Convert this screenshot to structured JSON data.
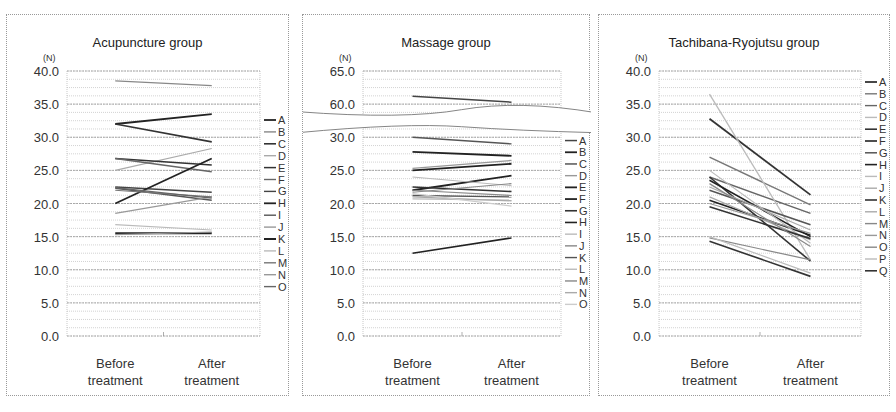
{
  "chart_data": [
    {
      "type": "line",
      "title": "Acupuncture group",
      "ylabel": "(N)",
      "xlabel": "",
      "categories": [
        "Before\ntreatment",
        "After\ntreatment"
      ],
      "yticks": [
        "0.0",
        "5.0",
        "10.0",
        "15.0",
        "20.0",
        "25.0",
        "30.0",
        "35.0",
        "40.0"
      ],
      "ylim": [
        0,
        40
      ],
      "grid": true,
      "legend_position": "right",
      "series": [
        {
          "name": "A",
          "values": [
            32.0,
            33.5
          ],
          "color": "#222222",
          "width": 1.8
        },
        {
          "name": "B",
          "values": [
            38.5,
            37.8
          ],
          "color": "#888888",
          "width": 1.2
        },
        {
          "name": "C",
          "values": [
            32.0,
            29.3
          ],
          "color": "#333333",
          "width": 1.6
        },
        {
          "name": "D",
          "values": [
            25.0,
            28.3
          ],
          "color": "#aaaaaa",
          "width": 1.2
        },
        {
          "name": "E",
          "values": [
            26.8,
            25.8
          ],
          "color": "#333333",
          "width": 1.5
        },
        {
          "name": "F",
          "values": [
            26.8,
            24.8
          ],
          "color": "#666666",
          "width": 1.4
        },
        {
          "name": "G",
          "values": [
            22.5,
            21.7
          ],
          "color": "#444444",
          "width": 1.4
        },
        {
          "name": "H",
          "values": [
            20.0,
            26.8
          ],
          "color": "#222222",
          "width": 1.8
        },
        {
          "name": "I",
          "values": [
            22.3,
            20.5
          ],
          "color": "#555555",
          "width": 1.4
        },
        {
          "name": "J",
          "values": [
            18.5,
            21.0
          ],
          "color": "#999999",
          "width": 1.2
        },
        {
          "name": "K",
          "values": [
            15.5,
            15.5
          ],
          "color": "#222222",
          "width": 2.0
        },
        {
          "name": "L",
          "values": [
            16.8,
            16.0
          ],
          "color": "#bbbbbb",
          "width": 1.2
        },
        {
          "name": "M",
          "values": [
            22.0,
            21.0
          ],
          "color": "#777777",
          "width": 1.2
        },
        {
          "name": "N",
          "values": [
            15.3,
            15.7
          ],
          "color": "#999999",
          "width": 1.2
        },
        {
          "name": "O",
          "values": [
            22.4,
            20.8
          ],
          "color": "#666666",
          "width": 1.2
        }
      ]
    },
    {
      "type": "line",
      "title": "Massage group",
      "ylabel": "(N)",
      "xlabel": "",
      "categories": [
        "Before\ntreatment",
        "After\ntreatment"
      ],
      "yticks": [
        "0.0",
        "5.0",
        "10.0",
        "15.0",
        "20.0",
        "25.0",
        "30.0",
        "60.0",
        "65.0"
      ],
      "ylim": [
        0,
        65
      ],
      "axis_break": [
        30,
        60
      ],
      "grid": true,
      "legend_position": "right",
      "series": [
        {
          "name": "A",
          "values": [
            61.2,
            60.3
          ],
          "color": "#444444",
          "width": 1.5
        },
        {
          "name": "B",
          "values": [
            27.8,
            27.2
          ],
          "color": "#222222",
          "width": 1.8
        },
        {
          "name": "C",
          "values": [
            30.0,
            29.0
          ],
          "color": "#555555",
          "width": 1.5
        },
        {
          "name": "D",
          "values": [
            25.3,
            26.5
          ],
          "color": "#999999",
          "width": 1.2
        },
        {
          "name": "E",
          "values": [
            25.0,
            26.0
          ],
          "color": "#222222",
          "width": 1.8
        },
        {
          "name": "F",
          "values": [
            22.0,
            24.2
          ],
          "color": "#222222",
          "width": 1.8
        },
        {
          "name": "G",
          "values": [
            22.5,
            21.8
          ],
          "color": "#333333",
          "width": 1.6
        },
        {
          "name": "H",
          "values": [
            12.5,
            14.8
          ],
          "color": "#222222",
          "width": 1.6
        },
        {
          "name": "I",
          "values": [
            24.0,
            22.7
          ],
          "color": "#bbbbbb",
          "width": 1.2
        },
        {
          "name": "J",
          "values": [
            21.7,
            23.0
          ],
          "color": "#888888",
          "width": 1.2
        },
        {
          "name": "K",
          "values": [
            21.2,
            21.0
          ],
          "color": "#555555",
          "width": 1.4
        },
        {
          "name": "L",
          "values": [
            20.7,
            20.5
          ],
          "color": "#bbbbbb",
          "width": 1.2
        },
        {
          "name": "M",
          "values": [
            22.0,
            21.2
          ],
          "color": "#888888",
          "width": 1.2
        },
        {
          "name": "N",
          "values": [
            21.0,
            20.4
          ],
          "color": "#aaaaaa",
          "width": 1.2
        },
        {
          "name": "O",
          "values": [
            21.5,
            19.6
          ],
          "color": "#cccccc",
          "width": 1.2
        }
      ]
    },
    {
      "type": "line",
      "title": "Tachibana-Ryojutsu group",
      "ylabel": "(N)",
      "xlabel": "",
      "categories": [
        "Before\ntreatment",
        "After\ntreatment"
      ],
      "yticks": [
        "0.0",
        "5.0",
        "10.0",
        "15.0",
        "20.0",
        "25.0",
        "30.0",
        "35.0",
        "40.0"
      ],
      "ylim": [
        0,
        40
      ],
      "grid": true,
      "legend_position": "right",
      "series": [
        {
          "name": "A",
          "values": [
            32.8,
            21.3
          ],
          "color": "#333333",
          "width": 1.8
        },
        {
          "name": "B",
          "values": [
            27.0,
            19.8
          ],
          "color": "#777777",
          "width": 1.4
        },
        {
          "name": "C",
          "values": [
            24.0,
            18.5
          ],
          "color": "#666666",
          "width": 1.4
        },
        {
          "name": "D",
          "values": [
            36.5,
            11.5
          ],
          "color": "#bbbbbb",
          "width": 1.3
        },
        {
          "name": "E",
          "values": [
            24.0,
            11.3
          ],
          "color": "#333333",
          "width": 1.6
        },
        {
          "name": "F",
          "values": [
            23.5,
            15.0
          ],
          "color": "#222222",
          "width": 1.6
        },
        {
          "name": "G",
          "values": [
            22.0,
            16.8
          ],
          "color": "#555555",
          "width": 1.5
        },
        {
          "name": "H",
          "values": [
            20.5,
            15.2
          ],
          "color": "#222222",
          "width": 1.6
        },
        {
          "name": "I",
          "values": [
            25.0,
            14.0
          ],
          "color": "#bbbbbb",
          "width": 1.2
        },
        {
          "name": "J",
          "values": [
            21.0,
            14.5
          ],
          "color": "#aaaaaa",
          "width": 1.2
        },
        {
          "name": "K",
          "values": [
            19.5,
            14.7
          ],
          "color": "#333333",
          "width": 1.6
        },
        {
          "name": "L",
          "values": [
            22.5,
            16.0
          ],
          "color": "#aaaaaa",
          "width": 1.2
        },
        {
          "name": "M",
          "values": [
            23.0,
            13.5
          ],
          "color": "#888888",
          "width": 1.2
        },
        {
          "name": "N",
          "values": [
            20.0,
            15.5
          ],
          "color": "#999999",
          "width": 1.2
        },
        {
          "name": "O",
          "values": [
            14.8,
            11.5
          ],
          "color": "#888888",
          "width": 1.2
        },
        {
          "name": "P",
          "values": [
            15.0,
            9.5
          ],
          "color": "#bbbbbb",
          "width": 1.2
        },
        {
          "name": "Q",
          "values": [
            14.3,
            9.0
          ],
          "color": "#333333",
          "width": 1.6
        }
      ]
    }
  ],
  "panels": [
    {
      "title": "Acupuncture group"
    },
    {
      "title": "Massage group"
    },
    {
      "title": "Tachibana-Ryojutsu group"
    }
  ]
}
